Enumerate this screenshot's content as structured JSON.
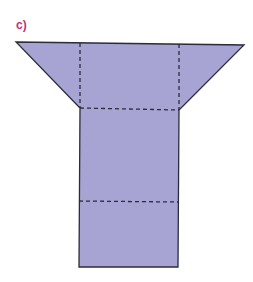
{
  "figure": {
    "label": "c)",
    "label_color": "#c2307a",
    "fill_color": "#a7a3d3",
    "stroke_color": "#2b2b3a",
    "shape": "net of a 3D solid (trapezoid top with folding flaps, rectangular stem)",
    "outline_points": "16,42 244,45 179,110 178,267 79,267 80,108",
    "fold_lines": [
      {
        "x1": 80,
        "y1": 43,
        "x2": 80,
        "y2": 108
      },
      {
        "x1": 179,
        "y1": 44,
        "x2": 179,
        "y2": 110
      },
      {
        "x1": 80,
        "y1": 108,
        "x2": 179,
        "y2": 110
      },
      {
        "x1": 79,
        "y1": 201,
        "x2": 178,
        "y2": 202
      }
    ]
  }
}
